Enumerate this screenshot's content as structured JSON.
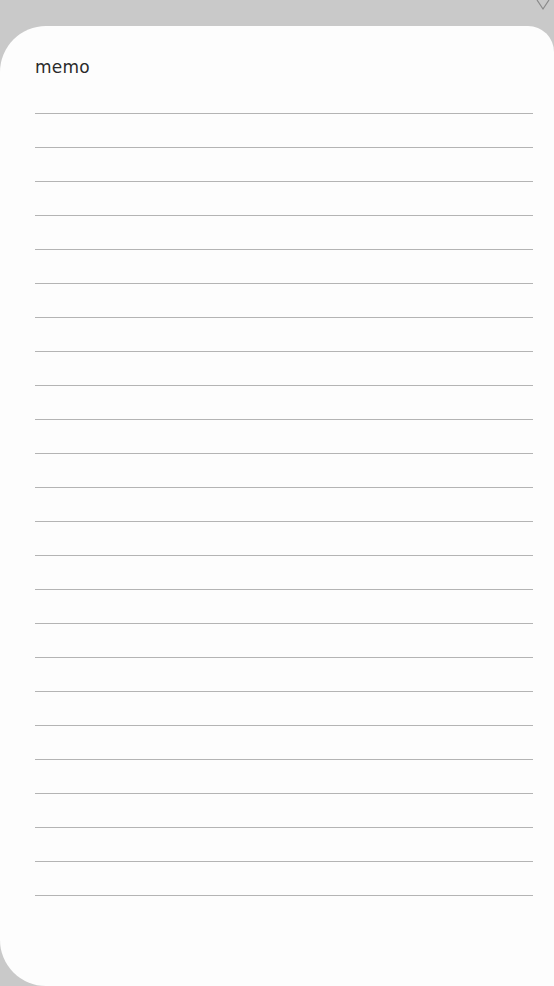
{
  "memo": {
    "title": "memo",
    "line_count": 24,
    "line_spacing_px": 34,
    "colors": {
      "background": "#c9c9c9",
      "card": "#fdfdfd",
      "rule": "#b4b4b4",
      "text": "#2a2a2a"
    },
    "icons": [
      "chevron-down-icon"
    ]
  }
}
